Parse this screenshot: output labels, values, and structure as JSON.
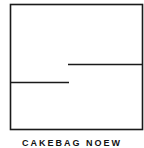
{
  "diagram": {
    "type": "line-drawing",
    "stroke_color": "#1a1a1a",
    "background": "#ffffff",
    "frame": {
      "x": 10,
      "y": 4,
      "width": 132,
      "height": 125
    },
    "lines": [
      {
        "name": "upper-partition",
        "x1": 68,
        "y1": 64,
        "x2": 142,
        "y2": 64
      },
      {
        "name": "lower-partition",
        "x1": 10,
        "y1": 82,
        "x2": 69,
        "y2": 82
      }
    ]
  },
  "caption": {
    "text": "CAKEBAG NOEW"
  }
}
